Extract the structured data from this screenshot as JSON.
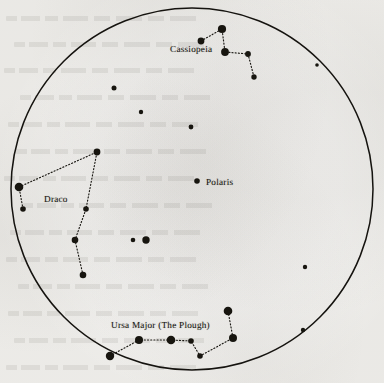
{
  "chart_data": {
    "type": "scatter",
    "xlabel": "",
    "ylabel": "",
    "grid": false,
    "legend": false,
    "xlim": [
      0,
      384
    ],
    "ylim": [
      0,
      383
    ],
    "sky_circle": {
      "cx": 192,
      "cy": 189,
      "r": 181,
      "stroke": "#15130f",
      "stroke_width": 1.5
    },
    "labels": [
      {
        "id": "cassiopeia",
        "text": "Cassiopeia",
        "x": 170,
        "y": 44
      },
      {
        "id": "draco",
        "text": "Draco",
        "x": 44,
        "y": 194
      },
      {
        "id": "polaris",
        "text": "Polaris",
        "x": 206,
        "y": 177
      },
      {
        "id": "ursa-major",
        "text": "Ursa Major (The Plough)",
        "x": 111,
        "y": 320
      }
    ],
    "constellations": [
      {
        "name": "Cassiopeia",
        "stars": [
          {
            "x": 201,
            "y": 41,
            "r": 3.4
          },
          {
            "x": 222,
            "y": 29,
            "r": 4.1
          },
          {
            "x": 225,
            "y": 52,
            "r": 3.9
          },
          {
            "x": 248,
            "y": 54,
            "r": 2.9
          },
          {
            "x": 254,
            "y": 77,
            "r": 2.7
          }
        ],
        "path": [
          0,
          1,
          2,
          3,
          4
        ]
      },
      {
        "name": "Draco",
        "stars": [
          {
            "x": 19,
            "y": 187,
            "r": 4.3
          },
          {
            "x": 23,
            "y": 209,
            "r": 2.8
          },
          {
            "x": 97,
            "y": 152,
            "r": 3.4
          },
          {
            "x": 86,
            "y": 209,
            "r": 2.8
          },
          {
            "x": 75,
            "y": 240,
            "r": 3.3
          },
          {
            "x": 83,
            "y": 275,
            "r": 3.3
          }
        ],
        "path": [
          1,
          0,
          2,
          3,
          4,
          5
        ]
      },
      {
        "name": "Ursa Major (The Plough)",
        "stars": [
          {
            "x": 110,
            "y": 356,
            "r": 4.2
          },
          {
            "x": 139,
            "y": 340,
            "r": 4.0
          },
          {
            "x": 171,
            "y": 340,
            "r": 4.3
          },
          {
            "x": 191,
            "y": 341,
            "r": 2.8
          },
          {
            "x": 200,
            "y": 356,
            "r": 2.8
          },
          {
            "x": 233,
            "y": 338,
            "r": 4.0
          },
          {
            "x": 228,
            "y": 311,
            "r": 4.3
          }
        ],
        "path": [
          0,
          1,
          2,
          3,
          4,
          5,
          6
        ]
      }
    ],
    "named_stars": [
      {
        "name": "Polaris",
        "x": 197,
        "y": 181,
        "r": 2.8
      }
    ],
    "background_stars": [
      {
        "x": 114,
        "y": 88,
        "r": 2.5
      },
      {
        "x": 141,
        "y": 112,
        "r": 2.2
      },
      {
        "x": 191,
        "y": 127,
        "r": 2.4
      },
      {
        "x": 317,
        "y": 65,
        "r": 1.8
      },
      {
        "x": 133,
        "y": 240,
        "r": 2.3
      },
      {
        "x": 146,
        "y": 240,
        "r": 3.7
      },
      {
        "x": 305,
        "y": 267,
        "r": 2.2
      },
      {
        "x": 303,
        "y": 330,
        "r": 2.2
      }
    ]
  }
}
